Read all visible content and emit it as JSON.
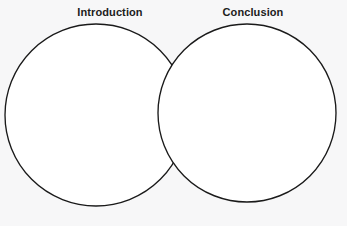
{
  "canvas": {
    "width": 347,
    "height": 226,
    "background_color": "#f7f7f8"
  },
  "diagram": {
    "type": "venn-diagram",
    "set_count": 2,
    "stroke_color": "#1a1a1a",
    "stroke_width": 1.35,
    "fill_color": "#ffffff",
    "label_color": "#1c1c1c",
    "circles": [
      {
        "id": "left",
        "label": "Introduction",
        "cx": 96,
        "cy": 115,
        "r": 91,
        "label_x": 110,
        "label_y": 6
      },
      {
        "id": "right",
        "label": "Conclusion",
        "cx": 247,
        "cy": 113,
        "r": 89,
        "label_x": 253,
        "label_y": 6
      }
    ],
    "intersection_points": [
      {
        "x": 177,
        "y": 55
      },
      {
        "x": 177,
        "y": 182
      }
    ],
    "regions": {
      "left_only_text": "",
      "overlap_text": "",
      "right_only_text": ""
    }
  },
  "labels": {
    "left": "Introduction",
    "right": "Conclusion"
  }
}
